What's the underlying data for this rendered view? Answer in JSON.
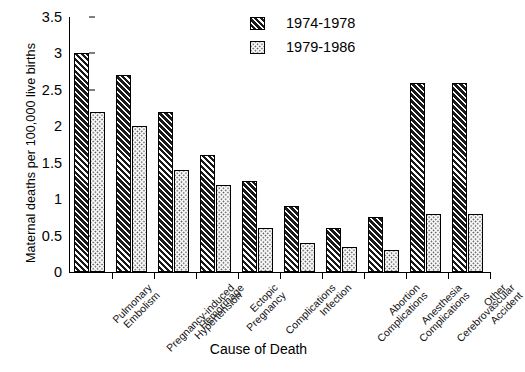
{
  "chart_data": {
    "type": "bar",
    "title": "",
    "xlabel": "Cause of Death",
    "ylabel": "Maternal deaths per 100,000 live births",
    "ylim": [
      0,
      3.5
    ],
    "yticks": [
      "0",
      "0.5",
      "1",
      "1.5",
      "2",
      "2.5",
      "3",
      "3.5"
    ],
    "ytick_values": [
      0,
      0.5,
      1,
      1.5,
      2,
      2.5,
      3,
      3.5
    ],
    "grid": false,
    "legend_position": "top-right",
    "categories": [
      "Pulmonary Embolism",
      "Pregnancy-induced Hypertension",
      "Hemorrhage",
      "Ectopic Pregnancy",
      "Complications",
      "Infection",
      "Abortion Complications",
      "Anesthesia Complications",
      "Cerebrovascular Accident",
      "Other"
    ],
    "category_lines": [
      [
        "Pulmonary",
        "Embolism"
      ],
      [
        "Pregnancy-induced",
        "Hypertension"
      ],
      [
        "Hemorrhage"
      ],
      [
        "Ectopic",
        "Pregnancy"
      ],
      [
        "Complications"
      ],
      [
        "Infection"
      ],
      [
        "Abortion",
        "Complications"
      ],
      [
        "Anesthesia",
        "Complications"
      ],
      [
        "Cerebrovascular",
        "Accident"
      ],
      [
        "Other"
      ]
    ],
    "series": [
      {
        "name": "1974-1978",
        "pattern": "diagonal-hatch",
        "color": "#1a1a1a",
        "values": [
          3.0,
          2.7,
          2.2,
          1.6,
          1.25,
          0.9,
          0.6,
          0.75,
          2.6,
          2.6
        ]
      },
      {
        "name": "1979-1986",
        "pattern": "dotted",
        "color": "#ffffff",
        "values": [
          2.2,
          2.0,
          1.4,
          1.2,
          0.6,
          0.4,
          0.35,
          0.3,
          0.8,
          0.8
        ]
      }
    ],
    "plotted_pairs": [
      {
        "category": "Pulmonary Embolism",
        "s1974_1978": 3.0,
        "s1979_1986": 2.2
      },
      {
        "category": "Pregnancy-induced Hypertension",
        "s1974_1978": 2.7,
        "s1979_1986": 2.0
      },
      {
        "category": "Hemorrhage",
        "s1974_1978": 2.2,
        "s1979_1986": 1.4
      },
      {
        "category": "Ectopic Pregnancy",
        "s1974_1978": 1.6,
        "s1979_1986": 1.2
      },
      {
        "category": "Complications",
        "s1974_1978": 1.25,
        "s1979_1986": 0.6
      },
      {
        "category": "Infection",
        "s1974_1978": 0.9,
        "s1979_1986": 0.4
      },
      {
        "category": "Abortion Complications",
        "s1974_1978": 0.6,
        "s1979_1986": 0.35
      },
      {
        "category": "Anesthesia Complications",
        "s1974_1978": 0.75,
        "s1979_1986": 0.3
      },
      {
        "category": "Cerebrovascular Accident",
        "s1974_1978": 2.6,
        "s1979_1986": 0.8
      }
    ]
  },
  "legend": {
    "items": [
      {
        "label": "1974-1978",
        "pattern": "diagonal-hatch"
      },
      {
        "label": "1979-1986",
        "pattern": "dotted"
      }
    ]
  }
}
